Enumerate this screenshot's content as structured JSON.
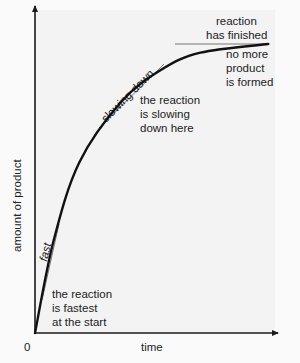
{
  "diagram": {
    "x_axis_label": "time",
    "y_axis_label": "amount of product",
    "origin_label": "0",
    "annotations": {
      "fast_tangent": "fast",
      "slowing_tangent": "slowing down",
      "finished_line": [
        "reaction",
        "has finished"
      ],
      "start_note": [
        "the reaction",
        "is fastest",
        "at the start"
      ],
      "middle_note": [
        "the reaction",
        "is slowing",
        "down here"
      ],
      "end_note": [
        "no more",
        "product",
        "is formed"
      ]
    },
    "colors": {
      "curve": "#111111",
      "axes": "#1a1a1a",
      "tangent_lines": "#777777",
      "text": "#222222"
    }
  },
  "chart_data": {
    "type": "line",
    "title": "",
    "xlabel": "time",
    "ylabel": "amount of product",
    "x": [
      0,
      0.08,
      0.19,
      0.37,
      0.54,
      0.71,
      1.0
    ],
    "series": [
      {
        "name": "amount of product",
        "values": [
          0,
          0.32,
          0.59,
          0.8,
          0.91,
          0.97,
          1.0
        ]
      }
    ],
    "xlim": [
      0,
      1.0
    ],
    "ylim": [
      0,
      1.0
    ],
    "grid": false,
    "legend": "none"
  }
}
